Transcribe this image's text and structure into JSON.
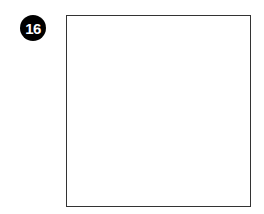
{
  "figure": {
    "number_badge": "16",
    "panel_content": ""
  },
  "colors": {
    "badge_bg": "#000000",
    "badge_text": "#ffffff",
    "box_border": "#333333"
  }
}
